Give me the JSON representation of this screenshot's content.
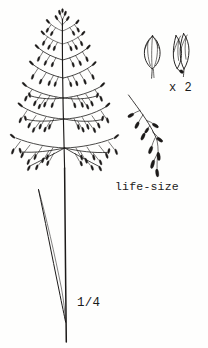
{
  "plate": {
    "kind": "botanical-line-drawing",
    "subject": "grass (Poaceae) flowering culm with open panicle",
    "background_color": "#fefefd",
    "ink_color": "#1c1a19",
    "width": 208,
    "height": 348
  },
  "labels": {
    "life_size": "life-size",
    "magnification": "x 2",
    "reduction": "1/4"
  },
  "figures": [
    {
      "id": "whole-plant",
      "name": "whole-plant-figure",
      "scale_label": "1/4",
      "description": "entire flowering culm: open pyramidal panicle above, slender culm with one long narrow leaf blade below"
    },
    {
      "id": "spikelets",
      "name": "spikelet-detail-figure",
      "scale_label": "x 2",
      "count": 2,
      "description": "two spikelets enlarged twice life-size; left closed and ovate, right with spreading lemmas"
    },
    {
      "id": "panicle-branch",
      "name": "panicle-branch-figure",
      "scale_label": "life-size",
      "description": "single panicle branch bearing spikelets, drawn at natural size"
    }
  ],
  "chart_data": {
    "type": "line",
    "title": "",
    "xlabel": "",
    "ylabel": "",
    "culm": {
      "x_top": 62,
      "y_top": 18,
      "x_bottom": 66,
      "y_bottom": 342
    },
    "panicle_nodes": [
      {
        "y": 34,
        "branch_count": 3,
        "length": 16,
        "spread": 34
      },
      {
        "y": 48,
        "branch_count": 4,
        "length": 22,
        "spread": 42
      },
      {
        "y": 63,
        "branch_count": 4,
        "length": 28,
        "spread": 48
      },
      {
        "y": 80,
        "branch_count": 5,
        "length": 36,
        "spread": 55
      },
      {
        "y": 97,
        "branch_count": 5,
        "length": 44,
        "spread": 60
      },
      {
        "y": 117,
        "branch_count": 6,
        "length": 50,
        "spread": 66
      },
      {
        "y": 145,
        "branch_count": 7,
        "length": 58,
        "spread": 72
      }
    ],
    "leaf": {
      "x_start": 38,
      "y_start": 190,
      "x_end": 62,
      "y_end": 318
    },
    "branch_detail": {
      "x_start": 129,
      "y_start": 95,
      "x_end": 158,
      "y_end": 176
    },
    "spikelet_positions": [
      {
        "x": 152,
        "y": 52,
        "form": "closed-ovate"
      },
      {
        "x": 180,
        "y": 50,
        "form": "open-spreading"
      }
    ]
  }
}
